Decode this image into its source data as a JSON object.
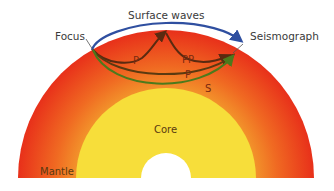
{
  "labels": {
    "surface_waves": "Surface waves",
    "focus": "Focus",
    "seismograph": "Seismograph",
    "core": "Core",
    "mantle": "Mantle"
  },
  "waves": [
    {
      "name": "P",
      "type": "reflected",
      "color": "#5a2a10"
    },
    {
      "name": "PP",
      "type": "reflected",
      "color": "#5a2a10"
    },
    {
      "name": "P",
      "type": "direct",
      "color": "#5a3a10"
    },
    {
      "name": "S",
      "type": "direct",
      "color": "#4a6a1a"
    }
  ],
  "colors": {
    "mantle_outer": "#e8301a",
    "mantle_inner": "#f08a2a",
    "core": "#f7de3a",
    "inner_core": "#ffffff",
    "surface_wave": "#2f4fa0",
    "p_wave": "#5a2a10",
    "s_wave": "#4c7a1c"
  }
}
